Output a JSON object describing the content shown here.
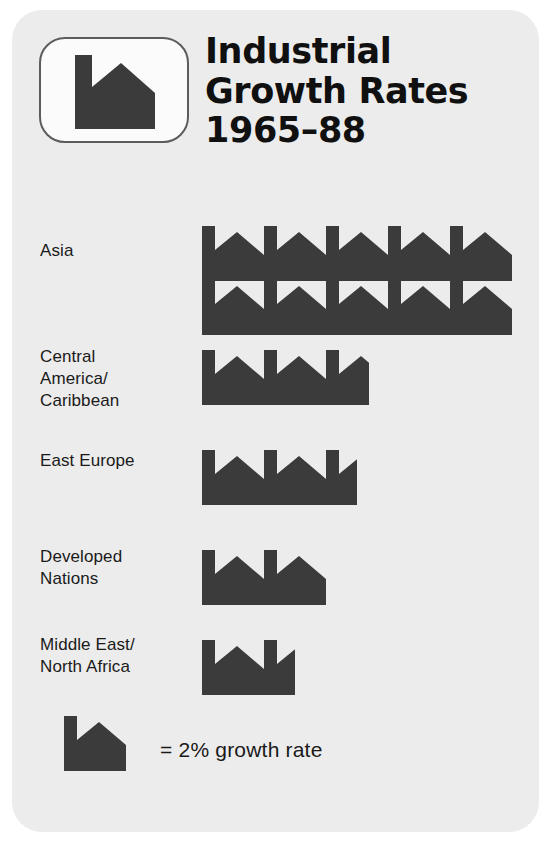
{
  "title": {
    "lines": [
      "Industrial",
      "Growth Rates",
      "1965–88"
    ],
    "full": "Industrial Growth Rates 1965–88"
  },
  "logo": {
    "icon_name": "factory-icon"
  },
  "colors": {
    "card_background": "#ececec",
    "icon_fill": "#3b3b3b",
    "text": "#1a1a1a",
    "logo_border": "#5c5c5c",
    "page_background": "#ffffff"
  },
  "legend": {
    "icon_name": "factory-icon",
    "text": "= 2% growth rate",
    "unit_value": 2,
    "unit_label": "% growth rate"
  },
  "chart_data": {
    "type": "pictogram",
    "title": "Industrial Growth Rates 1965–88",
    "xlabel": "",
    "ylabel": "",
    "unit_symbol": "factory",
    "unit_value": 2,
    "unit_units": "% growth rate",
    "legend_text": "= 2% growth rate",
    "categories": [
      "Asia",
      "Central America/Caribbean",
      "East Europe",
      "Developed Nations",
      "Middle East/North Africa"
    ],
    "icon_counts": [
      10,
      2.7,
      2.5,
      2,
      1.5
    ],
    "values": [
      20,
      5.4,
      5,
      4,
      3
    ],
    "value_unit": "%"
  },
  "rows": [
    {
      "label_lines": [
        "Asia"
      ],
      "label": "Asia",
      "icon_count": 10,
      "value": 20,
      "icon_lines": [
        {
          "full": 5,
          "partial": 0
        },
        {
          "full": 5,
          "partial": 0
        }
      ]
    },
    {
      "label_lines": [
        "Central",
        "America/",
        "Caribbean"
      ],
      "label": "Central America/Caribbean",
      "icon_count": 2.7,
      "value": 5.4,
      "icon_lines": [
        {
          "full": 2,
          "partial": 0.7
        }
      ]
    },
    {
      "label_lines": [
        "East Europe"
      ],
      "label": "East Europe",
      "icon_count": 2.5,
      "value": 5,
      "icon_lines": [
        {
          "full": 2,
          "partial": 0.5
        }
      ]
    },
    {
      "label_lines": [
        "Developed",
        "Nations"
      ],
      "label": "Developed Nations",
      "icon_count": 2,
      "value": 4,
      "icon_lines": [
        {
          "full": 2,
          "partial": 0
        }
      ]
    },
    {
      "label_lines": [
        "Middle East/",
        "North Africa"
      ],
      "label": "Middle East/North Africa",
      "icon_count": 1.5,
      "value": 3,
      "icon_lines": [
        {
          "full": 1,
          "partial": 0.5
        }
      ]
    }
  ],
  "layout": {
    "row_tops": [
      20,
      150,
      250,
      350,
      440
    ],
    "row_label_tops": [
      52,
      158,
      262,
      358,
      446
    ],
    "icon_line_offsets": [
      [
        18,
        72
      ],
      [
        12
      ],
      [
        12
      ],
      [
        12
      ],
      [
        12
      ]
    ],
    "icon_width": 62,
    "icon_pitch": 62
  }
}
